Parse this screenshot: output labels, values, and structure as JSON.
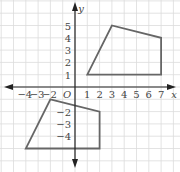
{
  "axes": {
    "x_label": "x",
    "y_label": "y",
    "origin_label": "O",
    "x_ticks": [
      "−4",
      "−3",
      "−2",
      "1",
      "2",
      "3",
      "4",
      "5",
      "6",
      "7"
    ],
    "x_tick_values": [
      -4,
      -3,
      -2,
      1,
      2,
      3,
      4,
      5,
      6,
      7
    ],
    "y_ticks": [
      "5",
      "4",
      "3",
      "2",
      "1",
      "−2",
      "−3",
      "−4"
    ],
    "y_tick_values": [
      5,
      4,
      3,
      2,
      1,
      -2,
      -3,
      -4
    ]
  },
  "colors": {
    "grid": "#dcdcdc",
    "axis": "#222222",
    "shape": "#666666"
  },
  "chart_data": {
    "type": "coordinate-plane",
    "title": "",
    "xlabel": "x",
    "ylabel": "y",
    "xlim": [
      -5,
      8
    ],
    "ylim": [
      -6.5,
      6.5
    ],
    "grid": true,
    "shapes": [
      {
        "name": "upper-quadrilateral",
        "vertices": [
          [
            1,
            1
          ],
          [
            3,
            5
          ],
          [
            7,
            4
          ],
          [
            7,
            1
          ]
        ]
      },
      {
        "name": "lower-quadrilateral",
        "vertices": [
          [
            -2,
            -1
          ],
          [
            2,
            -2
          ],
          [
            2,
            -5
          ],
          [
            -4,
            -5
          ]
        ]
      }
    ]
  }
}
